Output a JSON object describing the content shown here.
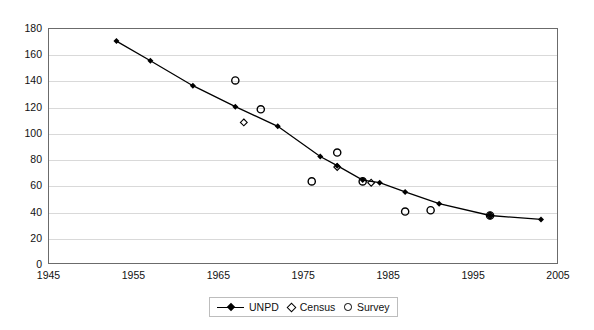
{
  "chart_data": {
    "type": "line",
    "title": "",
    "xlabel": "",
    "ylabel": "",
    "xlim": [
      1945,
      2005
    ],
    "ylim": [
      0,
      180
    ],
    "xticks": [
      "1945",
      "1955",
      "1965",
      "1975",
      "1985",
      "1995",
      "2005"
    ],
    "yticks": [
      "0",
      "20",
      "40",
      "60",
      "80",
      "100",
      "120",
      "140",
      "160",
      "180"
    ],
    "grid": "horizontal",
    "legend_position": "bottom-center",
    "series": [
      {
        "name": "UNPD",
        "marker": "diamond-filled",
        "line": true,
        "x": [
          1953,
          1957,
          1962,
          1967,
          1972,
          1977,
          1979,
          1982,
          1984,
          1987,
          1991,
          1997,
          2003
        ],
        "values": [
          170,
          155,
          136,
          120,
          105,
          82,
          75,
          64,
          62,
          55,
          46,
          37,
          34
        ]
      },
      {
        "name": "Census",
        "marker": "diamond-open",
        "line": false,
        "x": [
          1968,
          1979,
          1983,
          1997
        ],
        "values": [
          108,
          74,
          62,
          37
        ]
      },
      {
        "name": "Survey",
        "marker": "circle-open",
        "line": false,
        "x": [
          1967,
          1970,
          1976,
          1979,
          1982,
          1987,
          1990,
          1997
        ],
        "values": [
          140,
          118,
          63,
          85,
          63,
          40,
          41,
          37
        ]
      }
    ],
    "colors": {
      "series_line": "#000000",
      "marker": "#000000",
      "gridline": "#d9d9d9",
      "axis": "#6b6b6b",
      "background": "#ffffff"
    }
  },
  "legend": {
    "items": [
      {
        "label": "UNPD",
        "marker": "line-diamond"
      },
      {
        "label": "Census",
        "marker": "diamond-open"
      },
      {
        "label": "Survey",
        "marker": "circle-open"
      }
    ]
  },
  "axes": {
    "y_labels": [
      "180",
      "160",
      "140",
      "120",
      "100",
      "80",
      "60",
      "40",
      "20",
      "0"
    ],
    "x_labels": [
      "1945",
      "1955",
      "1965",
      "1975",
      "1985",
      "1995",
      "2005"
    ]
  }
}
